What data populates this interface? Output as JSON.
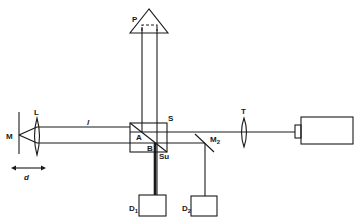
{
  "diagram": {
    "type": "optical-interferometer-schematic",
    "colors": {
      "line": "#1a1a1a",
      "background": "#ffffff"
    },
    "labels": {
      "mirror": "M",
      "lens_left": "L",
      "path_length": "l",
      "displacement": "d",
      "prism": "P",
      "beamsplitter_cube": "S",
      "point_a": "A",
      "point_b": "B",
      "substrate": "Su",
      "mirror2": "M",
      "mirror2_sub": "2",
      "telescope_lens": "T",
      "detector1": "D",
      "detector1_sub": "1",
      "detector2": "D",
      "detector2_sub": "2"
    },
    "components": [
      "mirror M",
      "lens L",
      "beamsplitter cube S",
      "roof prism P",
      "mirror M2",
      "lens T",
      "laser source",
      "detector D1",
      "detector D2"
    ]
  }
}
